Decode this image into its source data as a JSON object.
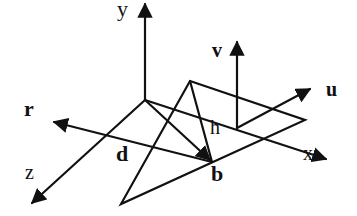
{
  "diagram": {
    "type": "3d-coordinate-geometry",
    "colors": {
      "stroke": "#111111",
      "background": "#ffffff"
    },
    "labels": {
      "y_axis": "y",
      "x_axis": "x",
      "z_axis": "z",
      "v_vector": "v",
      "u_vector": "u",
      "r_vector": "r",
      "d_vector": "d",
      "b_point": "b",
      "h_height": "h"
    },
    "axes": [
      {
        "name": "y",
        "from": [
          145,
          100
        ],
        "to": [
          145,
          2
        ]
      },
      {
        "name": "x",
        "from": [
          145,
          100
        ],
        "to": [
          328,
          160
        ]
      },
      {
        "name": "z",
        "from": [
          145,
          100
        ],
        "to": [
          30,
          205
        ]
      }
    ],
    "vectors": [
      {
        "name": "v",
        "from": [
          237,
          128
        ],
        "to": [
          237,
          40
        ]
      },
      {
        "name": "u",
        "from": [
          237,
          128
        ],
        "to": [
          312,
          88
        ]
      },
      {
        "name": "r",
        "from": [
          212,
          162
        ],
        "to": [
          52,
          122
        ]
      },
      {
        "name": "d",
        "from": [
          145,
          100
        ],
        "to": [
          212,
          162
        ]
      }
    ],
    "triangle": [
      [
        190,
        81
      ],
      [
        305,
        120
      ],
      [
        121,
        204
      ]
    ],
    "height_line": {
      "from": [
        190,
        81
      ],
      "to": [
        212,
        162
      ]
    },
    "point_b": [
      212,
      162
    ]
  }
}
